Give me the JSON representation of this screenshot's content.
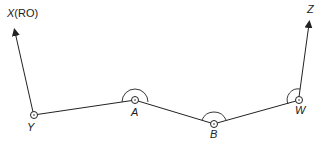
{
  "diagram": {
    "type": "traverse",
    "colors": {
      "line": "#222222",
      "background": "#ffffff"
    },
    "stations": [
      {
        "id": "Y",
        "label": "Y",
        "x": 34,
        "y": 115
      },
      {
        "id": "A",
        "label": "A",
        "x": 135,
        "y": 100
      },
      {
        "id": "B",
        "label": "B",
        "x": 214,
        "y": 124
      },
      {
        "id": "W",
        "label": "W",
        "x": 299,
        "y": 100
      }
    ],
    "reference_points": [
      {
        "id": "X",
        "label_main": "X",
        "label_suffix": "(RO)"
      },
      {
        "id": "Z",
        "label_main": "Z"
      }
    ]
  }
}
